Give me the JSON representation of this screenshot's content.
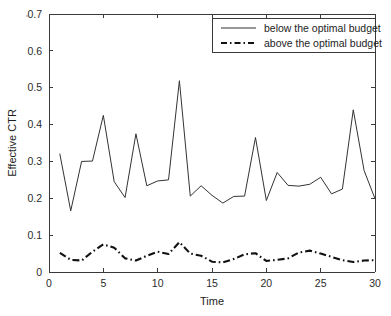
{
  "figure": {
    "name": "effective-ctr-over-time",
    "background": "#ffffff",
    "axis_color": "#3a3a3a"
  },
  "chart_data": {
    "type": "line",
    "title": "",
    "xlabel": "Time",
    "ylabel": "Effective CTR",
    "xlim": [
      0,
      30
    ],
    "ylim": [
      0,
      0.7
    ],
    "xticks": [
      0,
      5,
      10,
      15,
      20,
      25,
      30
    ],
    "xtick_labels": [
      "0",
      "5",
      "10",
      "15",
      "20",
      "25",
      "30"
    ],
    "yticks": [
      0,
      0.1,
      0.2,
      0.3,
      0.4,
      0.5,
      0.6,
      0.7
    ],
    "ytick_labels": [
      "0",
      "0.1",
      "0.2",
      "0.3",
      "0.4",
      "0.5",
      "0.6",
      "0.7"
    ],
    "grid": false,
    "legend_position": "top-right",
    "x": [
      1,
      2,
      3,
      4,
      5,
      6,
      7,
      8,
      9,
      10,
      11,
      12,
      13,
      14,
      15,
      16,
      17,
      18,
      19,
      20,
      21,
      22,
      23,
      24,
      25,
      26,
      27,
      28,
      29,
      30
    ],
    "series": [
      {
        "name": "below the optimal budget",
        "style": "solid",
        "color": "#333333",
        "values": [
          0.32,
          0.166,
          0.3,
          0.301,
          0.425,
          0.245,
          0.202,
          0.375,
          0.234,
          0.247,
          0.25,
          0.519,
          0.206,
          0.234,
          0.208,
          0.187,
          0.205,
          0.206,
          0.365,
          0.194,
          0.27,
          0.235,
          0.233,
          0.238,
          0.257,
          0.212,
          0.225,
          0.44,
          0.275,
          0.199
        ]
      },
      {
        "name": "above the optimal budget",
        "style": "dash-dot",
        "color": "#111111",
        "values": [
          0.052,
          0.033,
          0.031,
          0.055,
          0.075,
          0.066,
          0.037,
          0.031,
          0.044,
          0.055,
          0.049,
          0.081,
          0.05,
          0.044,
          0.028,
          0.026,
          0.035,
          0.048,
          0.051,
          0.03,
          0.033,
          0.037,
          0.053,
          0.058,
          0.05,
          0.041,
          0.032,
          0.027,
          0.031,
          0.032
        ]
      }
    ]
  },
  "legend": {
    "entries": [
      {
        "label": "below the optimal budget",
        "style": "solid"
      },
      {
        "label": "above the optimal budget",
        "style": "dash-dot"
      }
    ]
  }
}
